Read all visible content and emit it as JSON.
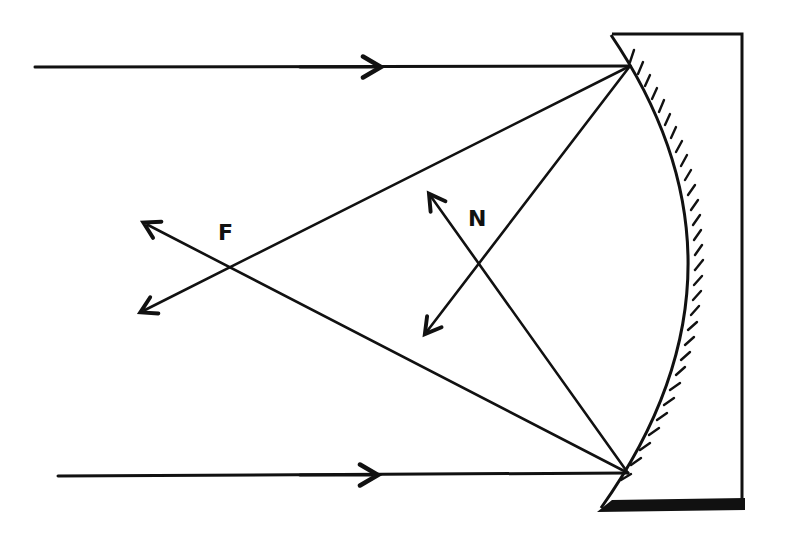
{
  "diagram": {
    "labels": {
      "focus": "F",
      "normal": "N"
    },
    "colors": {
      "ink": "#111111",
      "background": "#ffffff"
    },
    "elements": {
      "incident_rays": [
        {
          "name": "upper-incident-ray",
          "from": [
            35,
            67
          ],
          "to": [
            630,
            66
          ],
          "arrow_at": [
            375,
            67
          ]
        },
        {
          "name": "lower-incident-ray",
          "from": [
            58,
            476
          ],
          "to": [
            628,
            473
          ],
          "arrow_at": [
            372,
            475
          ]
        }
      ],
      "reflected_rays": [
        {
          "name": "upper-reflected-ray",
          "from": [
            630,
            66
          ],
          "to": [
            145,
            310
          ],
          "passes_through": "F"
        },
        {
          "name": "lower-reflected-ray",
          "from": [
            628,
            473
          ],
          "to": [
            148,
            225
          ],
          "passes_through": "F"
        }
      ],
      "normal_lines": [
        {
          "name": "normal-from-lower-point",
          "from": [
            628,
            473
          ],
          "to": [
            432,
            198
          ],
          "label": "N"
        },
        {
          "name": "line-from-upper-point",
          "from": [
            630,
            66
          ],
          "to": [
            428,
            330
          ]
        }
      ],
      "mirror": {
        "type": "concave",
        "arc": {
          "top": [
            612,
            35
          ],
          "middle": [
            695,
            270
          ],
          "bottom": [
            600,
            508
          ]
        },
        "back_edge_x": 742
      },
      "focus_point": [
        231,
        267
      ]
    }
  }
}
